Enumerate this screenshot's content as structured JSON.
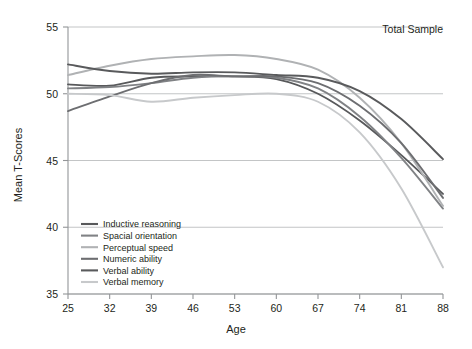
{
  "chart_data": {
    "type": "line",
    "title": "",
    "annotation": "Total Sample",
    "xlabel": "Age",
    "ylabel": "Mean T-Scores",
    "x": [
      25,
      32,
      39,
      46,
      53,
      60,
      67,
      74,
      81,
      88
    ],
    "categories": [
      "25",
      "32",
      "39",
      "46",
      "53",
      "60",
      "67",
      "74",
      "81",
      "88"
    ],
    "xlim": [
      25,
      88
    ],
    "ylim": [
      35,
      55
    ],
    "yticks": [
      35,
      40,
      45,
      50,
      55
    ],
    "ytick_labels": [
      "35",
      "40",
      "45",
      "50",
      "55"
    ],
    "grid": true,
    "grid_axis": "y",
    "legend_position": "lower-left-inside",
    "series": [
      {
        "name": "Inductive reasoning",
        "color": "#58595b",
        "values": [
          50.7,
          50.6,
          51.2,
          51.3,
          51.3,
          51.1,
          50.0,
          48.0,
          45.4,
          42.5
        ]
      },
      {
        "name": "Spacial orientation",
        "color": "#808285",
        "values": [
          50.4,
          50.5,
          50.8,
          51.2,
          51.3,
          51.2,
          50.4,
          48.3,
          45.2,
          41.4
        ]
      },
      {
        "name": "Perceptual speed",
        "color": "#b0b2b4",
        "values": [
          51.4,
          52.1,
          52.6,
          52.8,
          52.9,
          52.6,
          51.8,
          49.7,
          46.3,
          41.6
        ]
      },
      {
        "name": "Numeric ability",
        "color": "#6d6e71",
        "values": [
          48.7,
          49.8,
          50.8,
          51.4,
          51.3,
          51.3,
          50.8,
          49.1,
          46.3,
          42.2
        ]
      },
      {
        "name": "Verbal ability",
        "color": "#595a5c",
        "values": [
          52.2,
          51.7,
          51.5,
          51.6,
          51.6,
          51.4,
          51.2,
          50.2,
          48.1,
          45.1
        ]
      },
      {
        "name": "Verbal memory",
        "color": "#c7c9cb",
        "values": [
          50.0,
          49.9,
          49.4,
          49.7,
          49.9,
          50.0,
          49.4,
          47.1,
          42.9,
          37.0
        ]
      }
    ]
  },
  "legend": {
    "items": [
      {
        "label": "Inductive reasoning",
        "color": "#58595b"
      },
      {
        "label": "Spacial orientation",
        "color": "#808285"
      },
      {
        "label": "Perceptual speed",
        "color": "#b0b2b4"
      },
      {
        "label": "Numeric ability",
        "color": "#6d6e71"
      },
      {
        "label": "Verbal ability",
        "color": "#595a5c"
      },
      {
        "label": "Verbal memory",
        "color": "#c7c9cb"
      }
    ]
  }
}
